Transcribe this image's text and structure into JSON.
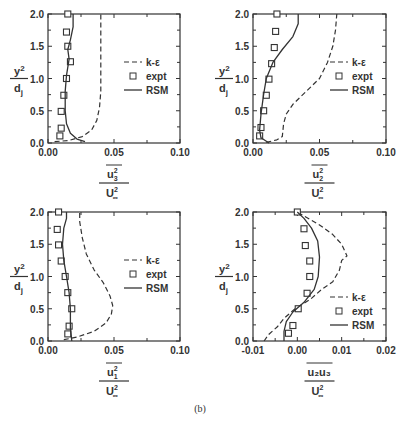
{
  "caption": "(b)",
  "legend": {
    "ke": "k-ε",
    "expt": "expt",
    "rsm": "RSM"
  },
  "ylabel": {
    "num": "y",
    "num_sup": "2",
    "den": "d",
    "den_sub": "j"
  },
  "chart_data": [
    {
      "type": "line",
      "id": "u3u3",
      "xlabel": {
        "num": "u",
        "num_sub": "3",
        "num_sup": "2",
        "den": "U",
        "den_sup": "2",
        "den_sub": "∞"
      },
      "ylabel": "y2/dj",
      "xlim": [
        0.0,
        0.1
      ],
      "ylim": [
        0.0,
        2.0
      ],
      "xticks": [
        "0.00",
        "0.05",
        "0.10"
      ],
      "yticks": [
        "0.0",
        "0.5",
        "1.0",
        "1.5",
        "2.0"
      ],
      "legend_position": "right-middle",
      "series": [
        {
          "name": "k-ε",
          "style": "dashed",
          "x": [
            0.005,
            0.016,
            0.026,
            0.033,
            0.037,
            0.039,
            0.04,
            0.04,
            0.04,
            0.04,
            0.04
          ],
          "y": [
            0.02,
            0.04,
            0.1,
            0.2,
            0.35,
            0.55,
            0.8,
            1.1,
            1.4,
            1.7,
            2.0
          ]
        },
        {
          "name": "expt",
          "style": "markers",
          "x": [
            0.015,
            0.014,
            0.015,
            0.017,
            0.014,
            0.012,
            0.01,
            0.01,
            0.009
          ],
          "y": [
            2.0,
            1.72,
            1.5,
            1.26,
            1.0,
            0.74,
            0.49,
            0.23,
            0.11
          ]
        },
        {
          "name": "RSM",
          "style": "solid",
          "x": [
            0.028,
            0.022,
            0.017,
            0.014,
            0.013,
            0.013,
            0.014,
            0.016,
            0.015,
            0.017,
            0.019,
            0.019
          ],
          "y": [
            0.02,
            0.06,
            0.15,
            0.3,
            0.5,
            0.8,
            1.05,
            1.3,
            1.45,
            1.6,
            1.8,
            2.0
          ]
        }
      ]
    },
    {
      "type": "line",
      "id": "u2u2",
      "xlabel": {
        "num": "u",
        "num_sub": "2",
        "num_sup": "2",
        "den": "U",
        "den_sup": "2",
        "den_sub": "∞"
      },
      "ylabel": "y2/dj",
      "xlim": [
        0.0,
        0.1
      ],
      "ylim": [
        0.0,
        2.0
      ],
      "xticks": [
        "0.00",
        "0.05",
        "0.10"
      ],
      "yticks": [
        "0.0",
        "0.5",
        "1.0",
        "1.5",
        "2.0"
      ],
      "legend_position": "right-middle",
      "series": [
        {
          "name": "k-ε",
          "style": "dashed",
          "x": [
            0.01,
            0.018,
            0.022,
            0.023,
            0.025,
            0.03,
            0.04,
            0.05,
            0.056,
            0.06,
            0.062,
            0.063
          ],
          "y": [
            0.01,
            0.05,
            0.1,
            0.3,
            0.45,
            0.6,
            0.8,
            1.0,
            1.25,
            1.5,
            1.75,
            2.0
          ]
        },
        {
          "name": "expt",
          "style": "markers",
          "x": [
            0.018,
            0.017,
            0.016,
            0.014,
            0.012,
            0.01,
            0.008,
            0.006,
            0.005
          ],
          "y": [
            2.0,
            1.73,
            1.48,
            1.23,
            0.99,
            0.74,
            0.5,
            0.24,
            0.11
          ]
        },
        {
          "name": "RSM",
          "style": "solid",
          "x": [
            0.012,
            0.006,
            0.005,
            0.006,
            0.008,
            0.01,
            0.015,
            0.022,
            0.03,
            0.034,
            0.034
          ],
          "y": [
            0.0,
            0.08,
            0.2,
            0.45,
            0.75,
            1.0,
            1.25,
            1.45,
            1.65,
            1.85,
            2.0
          ]
        }
      ]
    },
    {
      "type": "line",
      "id": "u1u1",
      "xlabel": {
        "num": "u",
        "num_sub": "1",
        "num_sup": "2",
        "den": "U",
        "den_sup": "2",
        "den_sub": "∞"
      },
      "ylabel": "y2/dj",
      "xlim": [
        0.0,
        0.1
      ],
      "ylim": [
        0.0,
        2.0
      ],
      "xticks": [
        "0.00",
        "0.05",
        "0.10"
      ],
      "yticks": [
        "0.0",
        "0.5",
        "1.0",
        "1.5",
        "2.0"
      ],
      "legend_position": "right-middle",
      "series": [
        {
          "name": "k-ε",
          "style": "dashed",
          "x": [
            0.012,
            0.022,
            0.035,
            0.044,
            0.048,
            0.049,
            0.047,
            0.042,
            0.035,
            0.029,
            0.026,
            0.024,
            0.024
          ],
          "y": [
            0.02,
            0.06,
            0.15,
            0.28,
            0.42,
            0.55,
            0.7,
            0.9,
            1.1,
            1.35,
            1.6,
            1.85,
            2.0
          ]
        },
        {
          "name": "expt",
          "style": "markers",
          "x": [
            0.008,
            0.007,
            0.008,
            0.01,
            0.013,
            0.015,
            0.018,
            0.016,
            0.015
          ],
          "y": [
            2.0,
            1.73,
            1.49,
            1.24,
            1.0,
            0.75,
            0.5,
            0.23,
            0.11
          ]
        },
        {
          "name": "RSM",
          "style": "solid",
          "x": [
            0.018,
            0.017,
            0.017,
            0.016,
            0.014,
            0.012,
            0.011,
            0.012,
            0.014,
            0.014
          ],
          "y": [
            0.0,
            0.2,
            0.5,
            0.75,
            1.0,
            1.25,
            1.5,
            1.75,
            1.9,
            2.0
          ]
        }
      ]
    },
    {
      "type": "line",
      "id": "u2u3",
      "xlabel": {
        "num": "u₂u₃",
        "num_sub": "",
        "num_sup": "",
        "den": "U",
        "den_sup": "2",
        "den_sub": "∞"
      },
      "ylabel": "y2/dj",
      "xlim": [
        -0.01,
        0.02
      ],
      "ylim": [
        0.0,
        2.0
      ],
      "xticks": [
        "-0.01",
        "0.00",
        "0.01",
        "0.02"
      ],
      "yticks": [
        "0.0",
        "0.5",
        "1.0",
        "1.5",
        "2.0"
      ],
      "legend_position": "right-bottom",
      "series": [
        {
          "name": "k-ε",
          "style": "dashed",
          "x": [
            -0.0075,
            -0.0065,
            -0.0045,
            -0.003,
            -0.0005,
            0.003,
            0.0055,
            0.008,
            0.0095,
            0.01,
            0.0112,
            0.01,
            0.008,
            0.005,
            0.0
          ],
          "y": [
            0.0,
            0.1,
            0.22,
            0.35,
            0.5,
            0.65,
            0.8,
            0.92,
            1.1,
            1.25,
            1.32,
            1.5,
            1.65,
            1.8,
            2.0
          ]
        },
        {
          "name": "expt",
          "style": "markers",
          "x": [
            0.0,
            0.0015,
            0.0018,
            0.0028,
            0.0028,
            0.0022,
            0.0002,
            -0.001,
            -0.002
          ],
          "y": [
            2.0,
            1.74,
            1.48,
            1.24,
            1.0,
            0.74,
            0.5,
            0.24,
            0.12
          ]
        },
        {
          "name": "RSM",
          "style": "solid",
          "x": [
            -0.003,
            -0.003,
            -0.0025,
            -0.001,
            0.0015,
            0.0038,
            0.0047,
            0.005,
            0.0046,
            0.0032,
            0.0015,
            0.0
          ],
          "y": [
            0.0,
            0.15,
            0.3,
            0.45,
            0.6,
            0.8,
            1.0,
            1.3,
            1.55,
            1.75,
            1.9,
            2.0
          ]
        }
      ]
    }
  ]
}
